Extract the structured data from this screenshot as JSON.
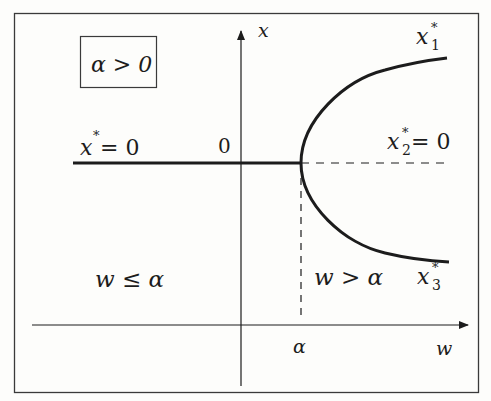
{
  "diagram": {
    "type": "pitchfork-bifurcation",
    "condition_box": "α > 0",
    "axes": {
      "horizontal_label": "w",
      "vertical_label": "x",
      "origin_label": "0",
      "alpha_tick_label": "α"
    },
    "branches": {
      "trivial_left": {
        "label_base": "x",
        "label_sup": "*",
        "label_rest": " = 0",
        "style": "solid"
      },
      "x1": {
        "label_base": "x",
        "label_sub": "1",
        "label_sup": "*",
        "style": "solid"
      },
      "x2": {
        "label_base": "x",
        "label_sub": "2",
        "label_sup": "*",
        "label_rest": " = 0",
        "style": "dashed"
      },
      "x3": {
        "label_base": "x",
        "label_sub": "3",
        "label_sup": "*",
        "style": "solid"
      }
    },
    "regions": {
      "left": "w ≤ α",
      "right": "w > α"
    },
    "colors": {
      "line": "#1c1c1c",
      "background": "#fdfdfb",
      "frame": "#3a3a3a"
    }
  }
}
